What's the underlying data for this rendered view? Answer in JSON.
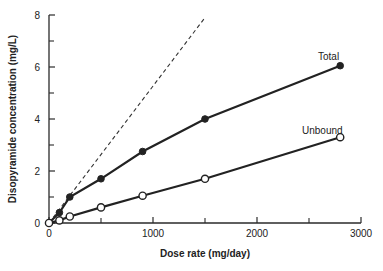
{
  "chart_data": {
    "type": "line",
    "title": "",
    "xlabel": "Dose rate (mg/day)",
    "ylabel": "Disopyramide concentration (mg/L)",
    "xlim": [
      0,
      3000
    ],
    "ylim": [
      0,
      8
    ],
    "xticks": [
      0,
      1000,
      2000,
      3000
    ],
    "xminor_ticks": [
      500,
      1500,
      2500
    ],
    "yticks": [
      0,
      2,
      4,
      6,
      8
    ],
    "yminor_ticks": [
      1,
      3,
      5,
      7
    ],
    "grid": false,
    "legend": "inline labels near series ends",
    "series": [
      {
        "name": "Total",
        "marker": "filled-circle",
        "x": [
          0,
          100,
          200,
          500,
          900,
          1500,
          2800
        ],
        "y": [
          0,
          0.4,
          1.0,
          1.7,
          2.75,
          4.0,
          6.05
        ]
      },
      {
        "name": "Unbound",
        "marker": "open-circle",
        "x": [
          0,
          100,
          200,
          500,
          900,
          1500,
          2800
        ],
        "y": [
          0,
          0.1,
          0.25,
          0.6,
          1.05,
          1.7,
          3.3
        ]
      },
      {
        "name": "Linear (dashed reference)",
        "style": "dashed",
        "x": [
          0,
          1500
        ],
        "y": [
          0,
          7.9
        ]
      }
    ]
  },
  "labels": {
    "total": "Total",
    "unbound": "Unbound",
    "xlabel": "Dose rate (mg/day)",
    "ylabel": "Disopyramide concentration (mg/L)"
  }
}
